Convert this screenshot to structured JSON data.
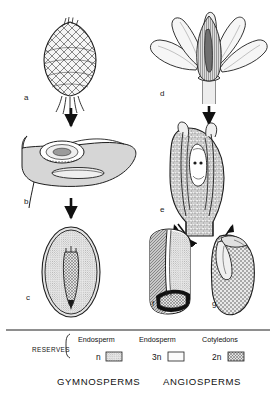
{
  "figure": {
    "title_visible": false,
    "panels": [
      {
        "id": "a",
        "label": "a",
        "caption_text": "a",
        "depicts": "gymnosperm-seed-cone",
        "column": "gymnosperms",
        "row": 1
      },
      {
        "id": "b",
        "label": "b",
        "caption_text": "b",
        "depicts": "ovuliferous-scale-with-ovule",
        "column": "gymnosperms",
        "row": 2
      },
      {
        "id": "c",
        "label": "c",
        "caption_text": "c",
        "depicts": "gymnosperm-seed-section",
        "column": "gymnosperms",
        "row": 3
      },
      {
        "id": "d",
        "label": "d",
        "caption_text": "d",
        "depicts": "angiosperm-flower",
        "column": "angiosperms",
        "row": 1
      },
      {
        "id": "e",
        "label": "e",
        "caption_text": "e",
        "depicts": "ovule-longitudinal-section",
        "column": "angiosperms",
        "row": 2
      },
      {
        "id": "f",
        "label": "f",
        "caption_text": "f",
        "depicts": "endospermic-seed-grain",
        "column": "angiosperms",
        "row": 3
      },
      {
        "id": "g",
        "label": "g",
        "caption_text": "g",
        "depicts": "non-endospermic-seed-bean",
        "column": "angiosperms",
        "row": 3
      }
    ]
  },
  "legend": {
    "row_label": "RESERVES",
    "entries": [
      {
        "tissue": "Endosperm",
        "ploidy": "n",
        "swatch": "stippled",
        "column": "gymnosperms"
      },
      {
        "tissue": "Endosperm",
        "ploidy": "3n",
        "swatch": "plain",
        "column": "angiosperms"
      },
      {
        "tissue": "Cotyledons",
        "ploidy": "2n",
        "swatch": "crosshatch",
        "column": "angiosperms"
      }
    ]
  },
  "groups": [
    {
      "name": "GYMNOSPERMS"
    },
    {
      "name": "ANGIOSPERMS"
    }
  ],
  "colors": {
    "ink": "#1a1a1a",
    "fill_light": "#d8d8d8",
    "fill_mid": "#bdbdbd",
    "fill_dark": "#8a8a8a",
    "paper": "#ffffff"
  }
}
